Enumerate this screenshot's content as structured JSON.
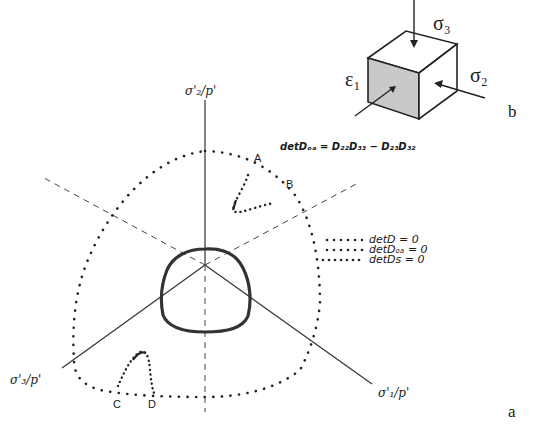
{
  "panel_a": {
    "label": "a",
    "axes": {
      "sigma1": "σ'₁/p'",
      "sigma2": "σ'₂/p'",
      "sigma3": "σ'₃/p'"
    },
    "equation": "detDₒₐ = D₂₂D₃₃ − D₂₃D₃₂",
    "points": {
      "A": "A",
      "B": "B",
      "C": "C",
      "D": "D"
    },
    "legend": [
      {
        "label": "detD = 0",
        "style": "dotted-sparse"
      },
      {
        "label": "detDₒₐ = 0",
        "style": "dotted"
      },
      {
        "label": "detDs = 0",
        "style": "dotted-dense"
      }
    ]
  },
  "panel_b": {
    "label": "b",
    "sigma3": "σ₃",
    "sigma2": "σ₂",
    "epsilon1": "ε₁"
  }
}
